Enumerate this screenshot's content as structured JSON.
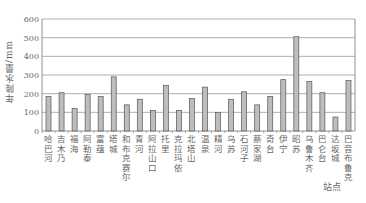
{
  "chart_data": {
    "type": "bar",
    "title": "",
    "xlabel": "站点",
    "ylabel": "年降水量/mm",
    "ylim": [
      0,
      600
    ],
    "yticks": [
      0,
      100,
      200,
      300,
      400,
      500,
      600
    ],
    "grid": true,
    "legend": null,
    "categories": [
      "哈巴河",
      "吉木乃",
      "福海",
      "阿勒泰",
      "富蕴",
      "塔城",
      "和布克赛尔",
      "青河",
      "阿拉山口",
      "托里",
      "克拉玛依",
      "北塔山",
      "温泉",
      "精河",
      "乌苏",
      "石河子",
      "蔡家湖",
      "奇台",
      "伊宁",
      "昭苏",
      "乌鲁木齐",
      "巴仑台",
      "达坂城",
      "巴音布鲁克"
    ],
    "values": [
      185,
      205,
      120,
      195,
      185,
      290,
      140,
      170,
      110,
      245,
      110,
      175,
      235,
      100,
      170,
      210,
      140,
      185,
      275,
      505,
      265,
      205,
      75,
      270
    ],
    "colors": {
      "bar_fill": "#bdbdbd",
      "bar_stroke": "#555555",
      "grid": "#9a9a9a",
      "axis": "#777777",
      "text": "#666666"
    }
  }
}
